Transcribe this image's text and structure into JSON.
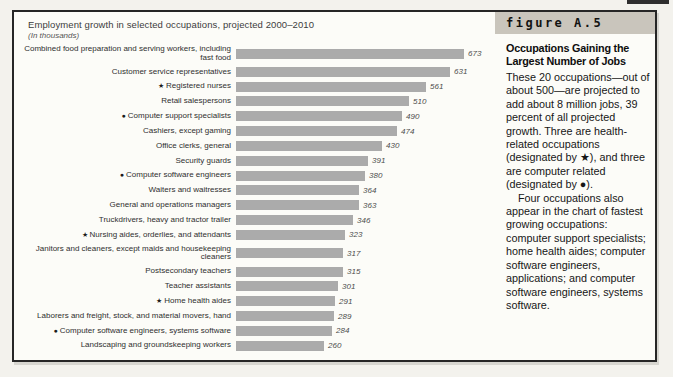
{
  "chart": {
    "title": "Employment growth in selected occupations, projected 2000–2010",
    "subtitle": "(In thousands)",
    "bar_color": "#ababab"
  },
  "icons": {
    "star": "★",
    "circle": "●"
  },
  "chart_data": {
    "type": "bar",
    "orientation": "horizontal",
    "title": "Employment growth in selected occupations, projected 2000–2010",
    "units_note": "(In thousands)",
    "xlim": [
      0,
      673
    ],
    "grid": false,
    "legend": "none",
    "value_labels_shown": true,
    "marker_legend": {
      "star": "health-related occupation",
      "circle": "computer-related occupation"
    },
    "categories": [
      "Combined food preparation and serving workers, including fast food",
      "Customer service representatives",
      "Registered nurses",
      "Retail salespersons",
      "Computer support specialists",
      "Cashiers, except gaming",
      "Office clerks, general",
      "Security guards",
      "Computer software engineers",
      "Waiters and waitresses",
      "General and operations managers",
      "Truckdrivers, heavy and tractor trailer",
      "Nursing aides, orderlies, and attendants",
      "Janitors and cleaners, except maids and housekeeping cleaners",
      "Postsecondary teachers",
      "Teacher assistants",
      "Home health aides",
      "Laborers and freight, stock, and material movers, hand",
      "Computer software engineers, systems software",
      "Landscaping and groundskeeping workers"
    ],
    "markers": [
      "",
      "",
      "star",
      "",
      "circle",
      "",
      "",
      "",
      "circle",
      "",
      "",
      "",
      "star",
      "",
      "",
      "",
      "star",
      "",
      "circle",
      ""
    ],
    "values": [
      673,
      631,
      561,
      510,
      490,
      474,
      430,
      391,
      380,
      364,
      363,
      346,
      323,
      317,
      315,
      301,
      291,
      289,
      284,
      260
    ]
  },
  "sidebar": {
    "figure_label": "figure A.5",
    "heading": "Occupations Gaining the Largest Number of Jobs",
    "paragraphs": [
      "These 20 occupations—out of about 500—are projected to add about 8 million jobs, 39 percent of all projected growth. Three are health-related occupations (designated by ★), and three are computer related (designated by ●).",
      "Four occupations also appear in the chart of fastest growing occupations: computer support specialists; home health aides; computer software engineers, applications; and computer software engineers, systems software."
    ]
  }
}
